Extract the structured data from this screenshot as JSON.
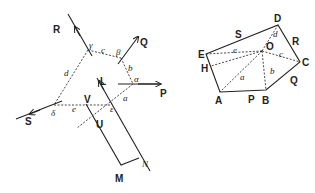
{
  "figure_left": {
    "force_labels": {
      "R": "R",
      "Q": "Q",
      "P": "P",
      "S": "S",
      "L": "L",
      "M": "M",
      "N": "N",
      "U": "U",
      "V": "V"
    },
    "angle_labels": {
      "gamma": "γ",
      "beta": "β",
      "alpha": "α",
      "delta": "δ",
      "epsilon": "ε"
    },
    "segment_labels": {
      "a": "a",
      "b": "b",
      "c": "c",
      "d": "d",
      "e": "e"
    }
  },
  "figure_right": {
    "vertex_labels": {
      "A": "A",
      "B": "B",
      "C": "C",
      "D": "D",
      "E": "E",
      "O": "O",
      "H": "H"
    },
    "side_labels": {
      "P": "P",
      "Q": "Q",
      "R": "R",
      "S": "S"
    },
    "ray_labels": {
      "a": "a",
      "b": "b",
      "c": "c",
      "d": "d",
      "e": "e"
    }
  }
}
